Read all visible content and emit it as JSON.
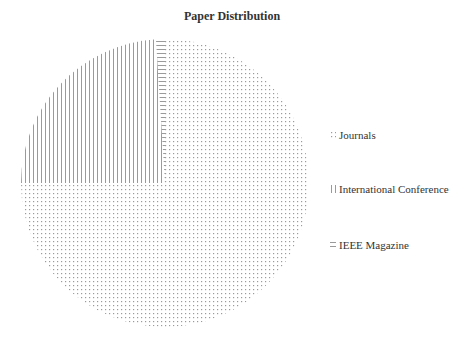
{
  "chart_data": {
    "type": "pie",
    "title": "Paper Distribution",
    "categories": [
      "Journals",
      "International Conference",
      "IEEE Magazine"
    ],
    "values": [
      75,
      24,
      1
    ],
    "patterns": [
      "dots",
      "vertical-lines",
      "horizontal-lines"
    ],
    "legend_position": "right",
    "colors": [
      "#b8b8b8",
      "#a8a8a8",
      "#b0b0b0"
    ]
  },
  "legend": {
    "items": [
      {
        "label": "Journals",
        "marker": "dots"
      },
      {
        "label": "International Conference",
        "marker": "vertical-lines"
      },
      {
        "label": "IEEE Magazine",
        "marker": "horizontal-lines"
      }
    ]
  }
}
